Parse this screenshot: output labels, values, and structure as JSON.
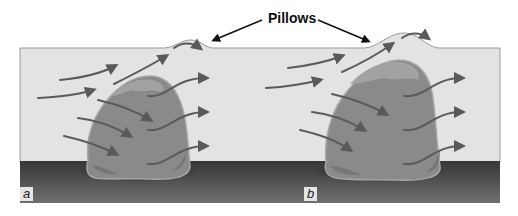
{
  "diagram": {
    "title": "Pillows",
    "panels": [
      {
        "label": "a"
      },
      {
        "label": "b"
      }
    ],
    "colors": {
      "water": "#e3e3e3",
      "water_edge": "#9a9a9a",
      "seafloor_top": "#3a3a3a",
      "seafloor_bottom": "#6a6a6a",
      "lava_body": "#8a8a8a",
      "lava_highlight": "#a8a8a8",
      "lava_shadow": "#6e6e6e",
      "arrow": "#5a5a5a",
      "pointer": "#111111"
    },
    "elements": {
      "pointer_arrows": 2,
      "flow_arrows_panel_a": 9,
      "flow_arrows_panel_b": 9
    }
  }
}
